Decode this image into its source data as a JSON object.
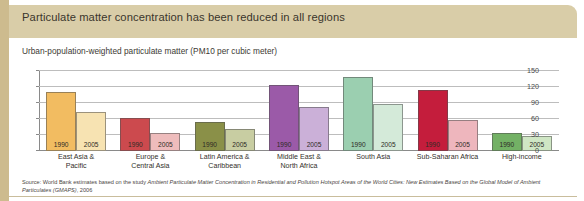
{
  "figure": {
    "title": "Particulate matter concentration has been reduced in all regions",
    "subtitle": "Urban-population-weighted particulate matter (PM10 per cubic meter)",
    "source": "Source: World Bank estimates based on the study ",
    "source_italic": "Ambient Particulate Matter Concentration in Residential and Pollution Hotspot Areas of the World Cities: New Estimates Based on the Global Model of Ambient Particulates (GMAPS)",
    "source_tail": ", 2006",
    "colors": {
      "title_band": "#d9cda8",
      "left_spine": "#cdbb8e",
      "gridline": "#bdbdbd",
      "axis": "#8a8a8a"
    }
  },
  "chart_data": {
    "type": "bar",
    "title": "Particulate matter concentration has been reduced in all regions",
    "subtitle": "Urban-population-weighted particulate matter (PM10 per cubic meter)",
    "xlabel": "",
    "ylabel": "Urban-population-weighted particulate matter (PM10 per cubic meter)",
    "ylim": [
      0,
      150
    ],
    "yticks": [
      0,
      30,
      60,
      90,
      120,
      150
    ],
    "grid": true,
    "legend": "none",
    "categories": [
      "East Asia & Pacific",
      "Europe & Central Asia",
      "Latin America & Caribbean",
      "Middle East & North Africa",
      "South Asia",
      "Sub-Saharan Africa",
      "High-income"
    ],
    "series": [
      {
        "name": "1990",
        "values": [
          110,
          62,
          55,
          124,
          138,
          115,
          33
        ]
      },
      {
        "name": "2005",
        "values": [
          73,
          33,
          42,
          83,
          88,
          58,
          28
        ]
      }
    ],
    "bar_colors": [
      {
        "1990": "#f2bc61",
        "2005": "#f7e3b2"
      },
      {
        "1990": "#cc4a4e",
        "2005": "#eebcbc"
      },
      {
        "1990": "#8a9048",
        "2005": "#c8cda2"
      },
      {
        "1990": "#9b5aa8",
        "2005": "#cbb0d8"
      },
      {
        "1990": "#9bcfb0",
        "2005": "#d4ead9"
      },
      {
        "1990": "#c41d3c",
        "2005": "#eeb6bd"
      },
      {
        "1990": "#73b165",
        "2005": "#cfe6c4"
      }
    ]
  },
  "yticks": [
    {
      "label": "150",
      "value": 150
    },
    {
      "label": "120",
      "value": 120
    },
    {
      "label": "90",
      "value": 90
    },
    {
      "label": "60",
      "value": 60
    },
    {
      "label": "30",
      "value": 30
    },
    {
      "label": "0",
      "value": 0
    }
  ],
  "categories": [
    {
      "line1": "East Asia &",
      "line2": "Pacific"
    },
    {
      "line1": "Europe &",
      "line2": "Central Asia"
    },
    {
      "line1": "Latin America &",
      "line2": "Caribbean"
    },
    {
      "line1": "Middle East &",
      "line2": "North Africa"
    },
    {
      "line1": "South Asia",
      "line2": ""
    },
    {
      "line1": "Sub-Saharan Africa",
      "line2": ""
    },
    {
      "line1": "High-income",
      "line2": ""
    }
  ]
}
